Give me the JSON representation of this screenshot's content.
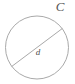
{
  "figure": {
    "name": "circle-with-diameter-diagram",
    "background_color": "#ffffff",
    "stroke_color": "#a9a9a9",
    "label_color": "#4f4f4f",
    "circle": {
      "center_x": 37,
      "center_y": 47.5,
      "radius": 31.5,
      "stroke_width": 1
    },
    "diameter": {
      "x1": 11.8,
      "y1": 66.4,
      "x2": 62.2,
      "y2": 28.6,
      "stroke_width": 1
    },
    "labels": {
      "circumference": {
        "text": "C",
        "x": 60,
        "y": 8,
        "font_size": 13,
        "style": "italic"
      },
      "diameter": {
        "text": "d",
        "x": 38,
        "y": 53,
        "font_size": 9,
        "style": "italic"
      }
    }
  }
}
